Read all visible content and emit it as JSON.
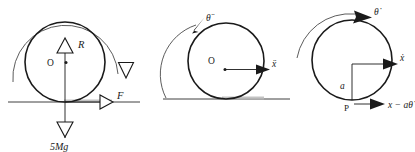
{
  "figure": {
    "title": "",
    "background_color": "#ffffff",
    "ink_color": "#1a1a1a",
    "panel_count": 3
  },
  "panels": [
    {
      "id": "panel-free-body",
      "name": "free-body-diagram",
      "circle": {
        "cx": 65,
        "cy": 62,
        "r": 40
      },
      "ground": {
        "x1": 8,
        "x2": 140,
        "y": 102,
        "visible": true
      },
      "center_label": "O",
      "labels": {
        "reaction": "R",
        "friction": "F",
        "weight": "5Mg"
      },
      "arc_label": "",
      "arrowhead_style": "hollow-triangle",
      "arc_direction": "clockwise"
    },
    {
      "id": "panel-accel",
      "name": "acceleration-diagram",
      "circle": {
        "cx": 226,
        "cy": 61,
        "r": 38
      },
      "ground": {
        "x1": 163,
        "x2": 290,
        "y": 99,
        "visible": true
      },
      "center_label": "O",
      "labels": {
        "linear_accel": "ẍ",
        "angular_accel": "θ̈"
      },
      "arrowhead_style": "solid-triangle",
      "arc_direction": "clockwise"
    },
    {
      "id": "panel-velocity",
      "name": "velocity-diagram",
      "circle": {
        "cx": 352,
        "cy": 60,
        "r": 40
      },
      "ground": {
        "visible": false
      },
      "contact_point_label": "P",
      "radius_label": "a",
      "labels": {
        "linear_velocity": "ẋ",
        "angular_velocity": "θ̇",
        "contact_velocity": "x − aθ̇"
      },
      "arrowhead_style": "solid-triangle",
      "arc_direction": "clockwise"
    }
  ]
}
